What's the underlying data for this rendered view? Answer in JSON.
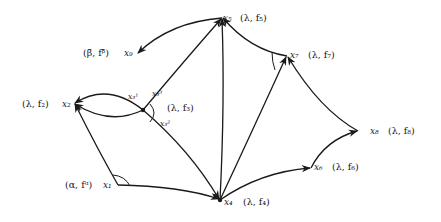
{
  "diagram": {
    "type": "directed-graph",
    "nodes": [
      {
        "id": "x1",
        "label": "x₁",
        "attr": "(α, fᵅ)",
        "x": 118,
        "y": 185
      },
      {
        "id": "x2",
        "label": "x₂",
        "attr": "(λ, f₂)",
        "x": 74,
        "y": 103
      },
      {
        "id": "x3",
        "label": "x₃",
        "attr": "(λ, f₃)",
        "x": 143,
        "y": 110
      },
      {
        "id": "x4",
        "label": "x₄",
        "attr": "(λ, f₄)",
        "x": 220,
        "y": 200
      },
      {
        "id": "x5",
        "label": "x₅",
        "attr": "(λ, f₅)",
        "x": 222,
        "y": 18
      },
      {
        "id": "x6",
        "label": "x₆",
        "attr": "(λ, f₆)",
        "x": 311,
        "y": 168
      },
      {
        "id": "x7",
        "label": "x₇",
        "attr": "(λ, f₇)",
        "x": 287,
        "y": 56
      },
      {
        "id": "x8",
        "label": "x₈",
        "attr": "(λ, f₈)",
        "x": 358,
        "y": 131
      },
      {
        "id": "x9",
        "label": "x₉",
        "attr": "(β̄, fᵝ̄)",
        "x": 137,
        "y": 53
      }
    ],
    "edges": [
      {
        "from": "x1",
        "to": "x2"
      },
      {
        "from": "x1",
        "to": "x4"
      },
      {
        "from": "x3",
        "to": "x2",
        "label": "upper arc"
      },
      {
        "from": "x3",
        "to": "x2",
        "label": "lower arc"
      },
      {
        "from": "x3",
        "to": "x5"
      },
      {
        "from": "x3",
        "to": "x4"
      },
      {
        "from": "x5",
        "to": "x9"
      },
      {
        "from": "x7",
        "to": "x5"
      },
      {
        "from": "x4",
        "to": "x5"
      },
      {
        "from": "x4",
        "to": "x7"
      },
      {
        "from": "x4",
        "to": "x6"
      },
      {
        "from": "x6",
        "to": "x8"
      },
      {
        "from": "x8",
        "to": "x7"
      }
    ],
    "port_labels": {
      "x3_1": "x₃¹",
      "x3_2": "x₃²",
      "x3_3": "x₃³"
    },
    "labels": {
      "x1": "x₁",
      "x1_attr": "(α, fᵅ)",
      "x2": "x₂",
      "x2_attr": "(λ, f₂)",
      "x3_attr": "(λ, f₃)",
      "x4": "x₄",
      "x4_attr": "(λ, f₄)",
      "x5": "x₅",
      "x5_attr": "(λ, f₅)",
      "x6": "x₆",
      "x6_attr": "(λ, f₆)",
      "x7": "x₇",
      "x7_attr": "(λ, f₇)",
      "x8": "x₈",
      "x8_attr": "(λ, f₈)",
      "x9": "x₉",
      "x9_attr": "(β̄, fᵝ̄)"
    }
  }
}
